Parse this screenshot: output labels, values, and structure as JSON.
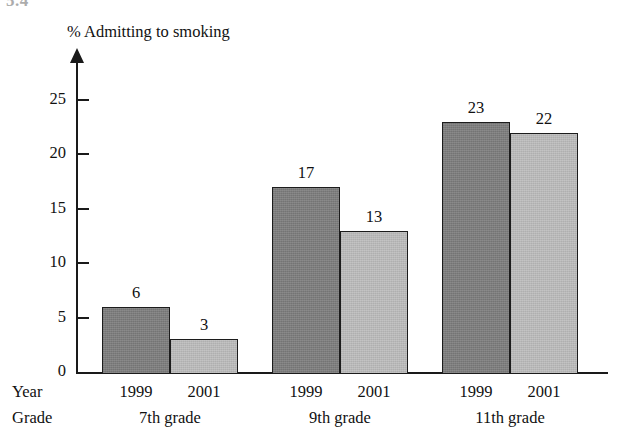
{
  "header_fragment": "5.4",
  "row_labels": {
    "year": "Year",
    "grade": "Grade"
  },
  "colors": {
    "bar_1999": "#7d7d7d",
    "bar_2001": "#b8b8b8",
    "axis": "#1a1a1a",
    "background": "#ffffff"
  },
  "chart_data": {
    "type": "bar",
    "title": "% Admitting to smoking",
    "xlabel": "",
    "ylabel": "% Admitting to smoking",
    "ylim": [
      0,
      27
    ],
    "yticks": [
      0,
      5,
      10,
      15,
      20,
      25
    ],
    "ytick_labels": [
      "0",
      "5",
      "10",
      "15",
      "20",
      "25"
    ],
    "grid": false,
    "legend": "none",
    "categories": [
      "7th grade",
      "9th grade",
      "11th grade"
    ],
    "series": [
      {
        "name": "1999",
        "values": [
          6,
          17,
          23
        ]
      },
      {
        "name": "2001",
        "values": [
          3,
          13,
          22
        ]
      }
    ],
    "bars": [
      {
        "group": "7th grade",
        "year": "1999",
        "value": 6,
        "label": "6",
        "style": "dark"
      },
      {
        "group": "7th grade",
        "year": "2001",
        "value": 3,
        "label": "3",
        "style": "light"
      },
      {
        "group": "9th grade",
        "year": "1999",
        "value": 17,
        "label": "17",
        "style": "dark"
      },
      {
        "group": "9th grade",
        "year": "2001",
        "value": 13,
        "label": "13",
        "style": "light"
      },
      {
        "group": "11th grade",
        "year": "1999",
        "value": 23,
        "label": "23",
        "style": "dark"
      },
      {
        "group": "11th grade",
        "year": "2001",
        "value": 22,
        "label": "22",
        "style": "light"
      }
    ]
  }
}
